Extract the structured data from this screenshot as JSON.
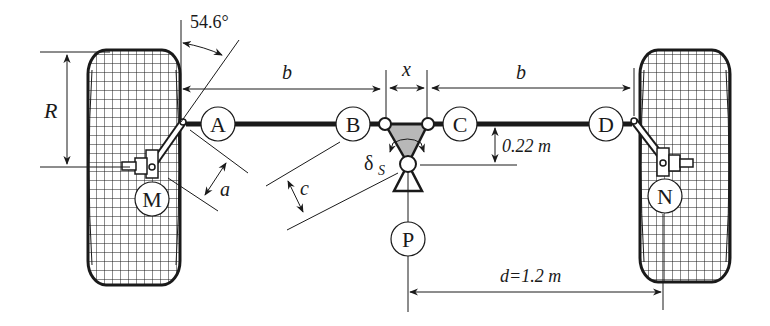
{
  "diagram": {
    "points": [
      {
        "id": "A",
        "label": "A"
      },
      {
        "id": "B",
        "label": "B"
      },
      {
        "id": "C",
        "label": "C"
      },
      {
        "id": "D",
        "label": "D"
      },
      {
        "id": "M",
        "label": "M"
      },
      {
        "id": "N",
        "label": "N"
      },
      {
        "id": "P",
        "label": "P"
      }
    ],
    "dimensions": {
      "angle": "54.6°",
      "b_left": "b",
      "b_right": "b",
      "x": "x",
      "R": "R",
      "a": "a",
      "c": "c",
      "delta": "δ",
      "delta_sub": "S",
      "height": "0.22 m",
      "d": "d=1.2 m"
    },
    "colors": {
      "line": "#1a1a1a",
      "shade": "#b8b8b8",
      "background": "#ffffff"
    }
  }
}
